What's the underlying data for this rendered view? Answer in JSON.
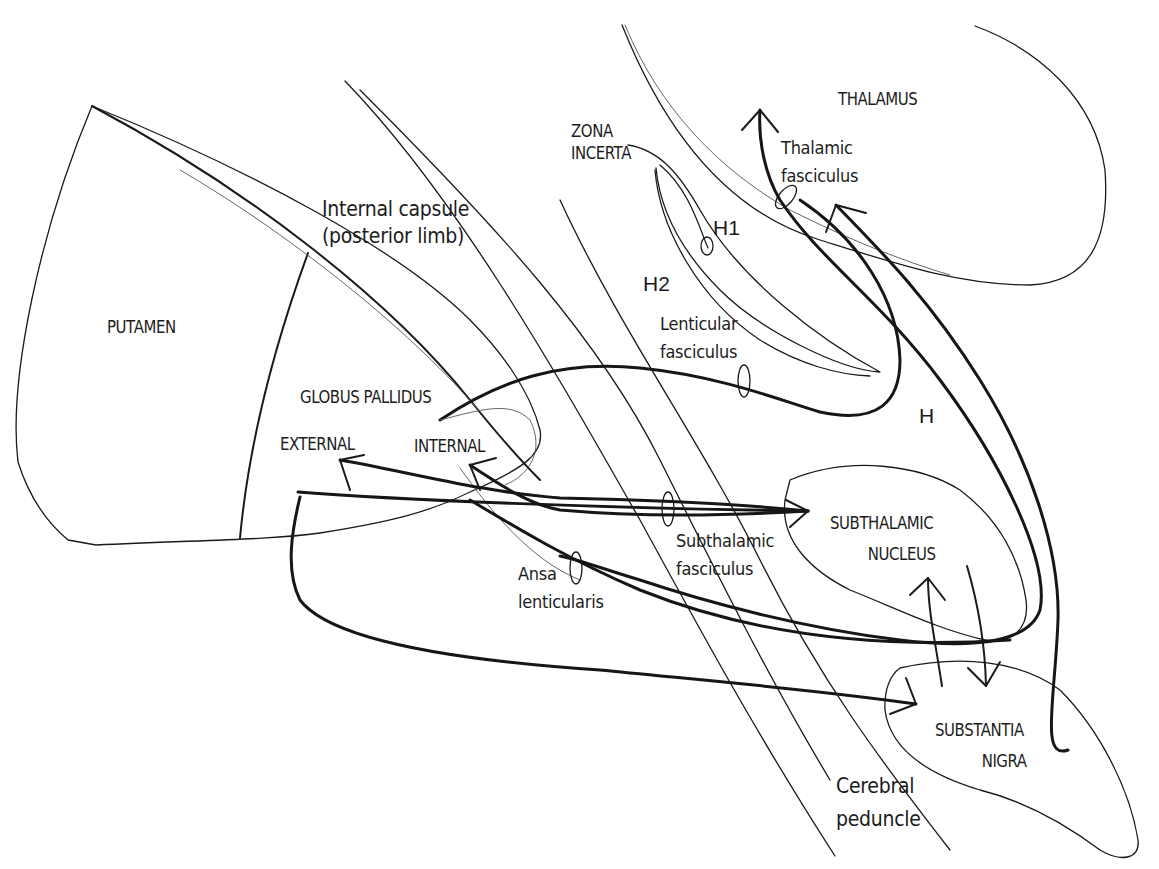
{
  "diagram": {
    "regions": {
      "putamen": "PUTAMEN",
      "globus_pallidus": "GLOBUS PALLIDUS",
      "gp_external": "EXTERNAL",
      "gp_internal": "INTERNAL",
      "thalamus": "THALAMUS",
      "zona_incerta_line1": "ZONA",
      "zona_incerta_line2": "INCERTA",
      "subthalamic_nucleus_line1": "SUBTHALAMIC",
      "subthalamic_nucleus_line2": "NUCLEUS",
      "substantia_nigra_line1": "SUBSTANTIA",
      "substantia_nigra_line2": "NIGRA"
    },
    "tracts": {
      "internal_capsule_line1": "Internal capsule",
      "internal_capsule_line2": "(posterior limb)",
      "thalamic_fasciculus_line1": "Thalamic",
      "thalamic_fasciculus_line2": "fasciculus",
      "lenticular_fasciculus_line1": "Lenticular",
      "lenticular_fasciculus_line2": "fasciculus",
      "subthalamic_fasciculus_line1": "Subthalamic",
      "subthalamic_fasciculus_line2": "fasciculus",
      "ansa_lenticularis_line1": "Ansa",
      "ansa_lenticularis_line2": "lenticularis",
      "cerebral_peduncle_line1": "Cerebral",
      "cerebral_peduncle_line2": "peduncle"
    },
    "fields": {
      "h": "H",
      "h1": "H1",
      "h2": "H2"
    },
    "colors": {
      "stroke": "#1a1a1a",
      "background": "#ffffff"
    }
  }
}
